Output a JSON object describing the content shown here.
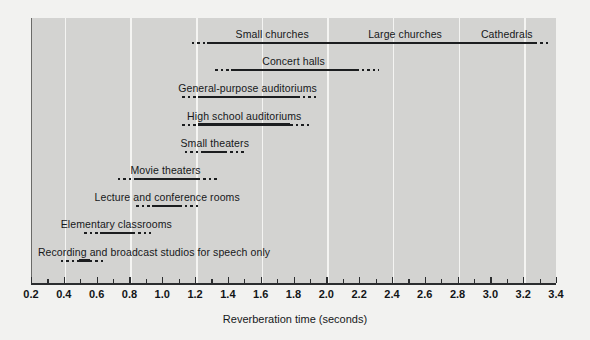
{
  "chart_data": {
    "type": "bar",
    "title": "",
    "xlabel": "Reverberation time (seconds)",
    "ylabel": "",
    "xlim": [
      0.2,
      3.4
    ],
    "grid": true,
    "gridlines": [
      0.4,
      0.8,
      1.2,
      1.6,
      2.0,
      2.4,
      2.8,
      3.2
    ],
    "legend": "none",
    "xticks": [
      0.2,
      0.4,
      0.6,
      0.8,
      1.0,
      1.2,
      1.4,
      1.6,
      1.8,
      2.0,
      2.2,
      2.4,
      2.6,
      2.8,
      3.0,
      3.2,
      3.4
    ],
    "xticklabels": [
      "0.2",
      "0.4",
      "0.6",
      "0.8",
      "1.0",
      "1.2",
      "1.4",
      "1.6",
      "1.8",
      "2.0",
      "2.2",
      "2.4",
      "2.6",
      "2.8",
      "3.0",
      "3.2",
      "3.4"
    ],
    "minor_xticks": [
      0.3,
      0.5,
      0.7,
      0.9,
      1.1,
      1.3,
      1.5,
      1.7,
      1.9,
      2.1,
      2.3,
      2.5,
      2.7,
      2.9,
      3.1,
      3.3
    ],
    "categories": [
      "Small churches",
      "Large churches",
      "Cathedrals",
      "Concert halls",
      "General-purpose auditoriums",
      "High school auditoriums",
      "Small theaters",
      "Movie theaters",
      "Lecture and conference rooms",
      "Elementary classrooms",
      "Recording and broadcast studios for speech only"
    ],
    "ranges": [
      {
        "label": "Small churches",
        "solid_start": 1.27,
        "solid_end": 3.27,
        "dot_start": 1.18,
        "dot_end": 3.37,
        "row": 0,
        "label_x": 1.67,
        "shared_row_labels": [
          "Small churches",
          "Large churches",
          "Cathedrals"
        ]
      },
      {
        "label": "Concert halls",
        "solid_start": 1.42,
        "solid_end": 2.18,
        "dot_start": 1.32,
        "dot_end": 2.32,
        "row": 1,
        "label_x": 1.8
      },
      {
        "label": "General-purpose auditoriums",
        "solid_start": 1.22,
        "solid_end": 1.82,
        "dot_start": 1.12,
        "dot_end": 1.95,
        "row": 2,
        "label_x": 1.52
      },
      {
        "label": "High school auditoriums",
        "solid_start": 1.22,
        "solid_end": 1.78,
        "dot_start": 1.12,
        "dot_end": 1.9,
        "row": 3,
        "label_x": 1.5
      },
      {
        "label": "Small theaters",
        "solid_start": 1.24,
        "solid_end": 1.38,
        "dot_start": 1.14,
        "dot_end": 1.5,
        "row": 4,
        "label_x": 1.32
      },
      {
        "label": "Movie theaters",
        "solid_start": 0.83,
        "solid_end": 1.22,
        "dot_start": 0.73,
        "dot_end": 1.34,
        "row": 5,
        "label_x": 1.02
      },
      {
        "label": "Lecture and conference rooms",
        "solid_start": 0.94,
        "solid_end": 1.1,
        "dot_start": 0.84,
        "dot_end": 1.22,
        "row": 6,
        "label_x": 1.03
      },
      {
        "label": "Elementary classrooms",
        "solid_start": 0.62,
        "solid_end": 0.82,
        "dot_start": 0.52,
        "dot_end": 0.93,
        "row": 7,
        "label_x": 0.72
      },
      {
        "label": "Recording and broadcast studios for speech only",
        "solid_start": 0.49,
        "solid_end": 0.56,
        "dot_start": 0.38,
        "dot_end": 0.64,
        "row": 8,
        "label_x": 0.95
      }
    ],
    "row_sublabels": [
      {
        "text": "Small churches",
        "x": 1.67,
        "row": 0
      },
      {
        "text": "Large churches",
        "x": 2.48,
        "row": 0
      },
      {
        "text": "Cathedrals",
        "x": 3.1,
        "row": 0
      }
    ]
  },
  "axis": {
    "x_label": "Reverberation time (seconds)"
  }
}
